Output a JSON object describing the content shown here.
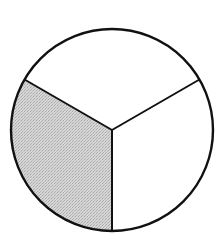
{
  "figure": {
    "total_parts": 3,
    "shaded_parts": 1,
    "fraction_shaded": "1/3",
    "center": [
      112,
      130
    ],
    "radius": 101,
    "stroke_color": "#111111",
    "shade_color": "#cccccc",
    "background_color": "#ffffff",
    "sectors": [
      {
        "name": "upper-left",
        "start_deg": 210,
        "end_deg": 330,
        "shaded": false
      },
      {
        "name": "upper-right",
        "start_deg": 330,
        "end_deg": 90,
        "shaded": false
      },
      {
        "name": "bottom",
        "start_deg": 90,
        "end_deg": 210,
        "shaded": true
      }
    ]
  }
}
